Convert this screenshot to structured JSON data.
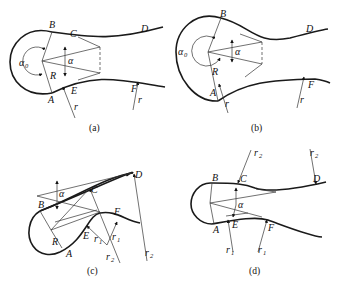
{
  "figure": {
    "panels": [
      {
        "id": "a",
        "caption": "(a)",
        "labels": {
          "B": "B",
          "C": "C",
          "D": "D",
          "A": "A",
          "E": "E",
          "F": "F",
          "R": "R",
          "alpha": "α",
          "alpha0": "α",
          "alpha0_sub": "0",
          "r1": "r",
          "r2": "r"
        }
      },
      {
        "id": "b",
        "caption": "(b)",
        "labels": {
          "B": "B",
          "D": "D",
          "A": "A",
          "F": "F",
          "R": "R",
          "alpha": "α",
          "alpha0": "α",
          "alpha0_sub": "0",
          "r1": "r",
          "r2": "r"
        }
      },
      {
        "id": "c",
        "caption": "(c)",
        "labels": {
          "B": "B",
          "C": "C",
          "D": "D",
          "A": "A",
          "E": "E",
          "F": "F",
          "R": "R",
          "alpha": "α",
          "r1a": "r",
          "r1a_sub": "1",
          "r1b": "r",
          "r1b_sub": "1",
          "r2a": "r",
          "r2a_sub": "2",
          "r2b": "r",
          "r2b_sub": "2"
        }
      },
      {
        "id": "d",
        "caption": "(d)",
        "labels": {
          "B": "B",
          "C": "C",
          "D": "D",
          "A": "A",
          "E": "E",
          "F": "F",
          "alpha": "α",
          "r2a": "r",
          "r2a_sub": "2",
          "r2b": "r",
          "r2b_sub": "2",
          "r1a": "r",
          "r1a_sub": "1",
          "r1b": "r",
          "r1b_sub": "1"
        }
      }
    ]
  }
}
